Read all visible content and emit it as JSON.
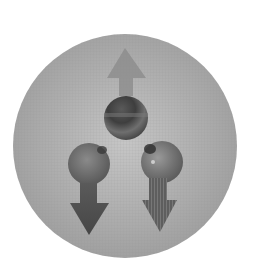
{
  "diagram": {
    "description": "Large gray sphere containing three small spheres with arrows: one sphere with an upward arrow at top, two spheres with downward arrows below",
    "colors": {
      "background": "#ffffff",
      "sphere_fill": "#ababab",
      "sphere_highlight": "#c6c6c6",
      "sphere_edge": "#9a9a9a",
      "ball_dark": "#3e3e3e",
      "ball_mid": "#6e6e6e",
      "ball_light": "#9a9a9a",
      "arrow_up": "#8a8a8a",
      "arrow_down_left": "#4f4f4f",
      "arrow_down_right": "#5e5e5e"
    },
    "container_sphere": {
      "cx": 125,
      "cy": 146,
      "r": 112
    },
    "particles": [
      {
        "id": "top",
        "cx": 126,
        "cy": 118,
        "r": 22,
        "arrow": "up"
      },
      {
        "id": "bottom-left",
        "cx": 89,
        "cy": 164,
        "r": 21,
        "arrow": "down"
      },
      {
        "id": "bottom-right",
        "cx": 162,
        "cy": 162,
        "r": 21,
        "arrow": "down"
      }
    ],
    "arrows": [
      {
        "id": "up",
        "direction": "up",
        "points": "125,48 146,78 133,78 133,96 119,96 119,78 107,78"
      },
      {
        "id": "down-left",
        "direction": "down",
        "points": "80,183 97,183 97,203 109,203 89,235 70,203 80,203"
      },
      {
        "id": "down-right",
        "direction": "down",
        "points": "149,178 167,178 167,200 177,200 160,232 142,200 149,200"
      }
    ]
  }
}
